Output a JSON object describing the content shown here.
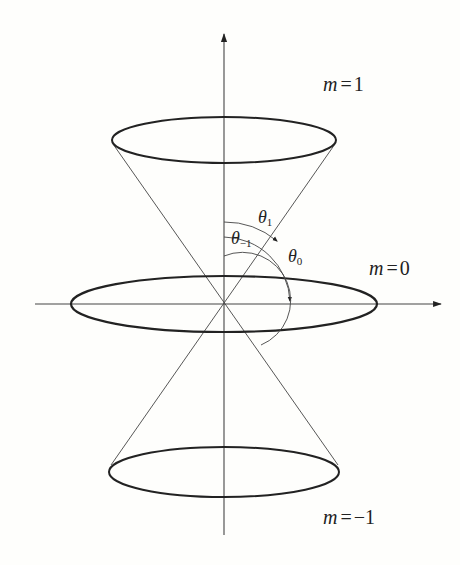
{
  "diagram": {
    "colors": {
      "background": "#fefefc",
      "line": "#222222",
      "thin_line": "#444444"
    },
    "labels": {
      "m_top": {
        "var": "m",
        "eq": "=",
        "val": "1"
      },
      "m_mid": {
        "var": "m",
        "eq": "=",
        "val": "0"
      },
      "m_bot": {
        "var": "m",
        "eq": "=",
        "val": "−1"
      },
      "theta_1": {
        "symbol": "θ",
        "sub": "1"
      },
      "theta_0": {
        "symbol": "θ",
        "sub": "0"
      },
      "theta_m1": {
        "symbol": "θ",
        "sub": "−1"
      }
    },
    "geometry": {
      "origin": [
        224,
        304
      ],
      "ellipses": [
        {
          "name": "m=1",
          "cx": 224,
          "cy": 140,
          "rx": 112,
          "ry": 23
        },
        {
          "name": "m=0",
          "cx": 224,
          "cy": 304,
          "rx": 153,
          "ry": 28
        },
        {
          "name": "m=-1",
          "cx": 224,
          "cy": 472,
          "rx": 115,
          "ry": 25
        }
      ]
    }
  }
}
